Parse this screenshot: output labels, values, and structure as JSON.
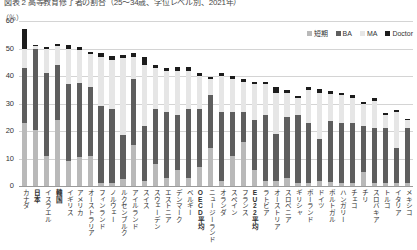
{
  "figure": {
    "title": "図表 2  高等教育修了者の割合（25～34歳、学位レベル別、2021年）",
    "unit_label": "（％）"
  },
  "legend": {
    "position": "top-right",
    "items": [
      {
        "label": "短期",
        "color": "#b9b9b9",
        "key": "short"
      },
      {
        "label": "BA",
        "color": "#5e5e5e",
        "key": "ba"
      },
      {
        "label": "MA",
        "color": "#e6e6e6",
        "key": "ma"
      },
      {
        "label": "Doctor",
        "color": "#1c1c1c",
        "key": "doc"
      }
    ]
  },
  "chart_data": {
    "type": "bar",
    "stacked": true,
    "title": "図表 2  高等教育修了者の割合（25～34歳、学位レベル別、2021年）",
    "xlabel": "",
    "ylabel": "（％）",
    "ylim": [
      0,
      60
    ],
    "yticks": [
      0,
      10,
      20,
      30,
      40,
      50,
      60
    ],
    "grid": true,
    "legend_position": "top-right",
    "categories": [
      "カナダ",
      "日本",
      "イスラエル",
      "韓国",
      "イギリス",
      "アメリカ",
      "オーストラリア",
      "フィンランド",
      "ノルウェー",
      "ルクセンブルク",
      "アイルランド",
      "スイス",
      "スウェーデン",
      "エストニア",
      "デンマーク",
      "ベルギー",
      "OECD平均",
      "ニュージーランド",
      "オランダ",
      "スペイン",
      "フランス",
      "EU22平均",
      "ラトビア",
      "オーストリア",
      "スロベニア",
      "ギリシャ",
      "ポーランド",
      "ドイツ",
      "ポルトガル",
      "ハンガリー",
      "チェコ",
      "チリ",
      "スロバキア",
      "トルコ",
      "イタリア",
      "メキシコ"
    ],
    "series": [
      {
        "name": "短期",
        "color": "#b9b9b9",
        "values": [
          23.0,
          20.5,
          11.0,
          24.0,
          9.0,
          10.5,
          11.0,
          1.0,
          1.0,
          2.5,
          15.0,
          2.0,
          8.0,
          3.0,
          6.0,
          3.0,
          7.0,
          14.0,
          2.0,
          11.0,
          16.0,
          6.0,
          2.0,
          2.0,
          3.0,
          1.0,
          1.0,
          2.0,
          1.5,
          1.0,
          1.0,
          5.0,
          1.0,
          1.0,
          1.0,
          1.0
        ]
      },
      {
        "name": "BA",
        "color": "#5e5e5e",
        "values": [
          20.0,
          29.5,
          30.0,
          20.0,
          28.0,
          27.0,
          25.0,
          28.0,
          27.0,
          16.0,
          24.0,
          20.0,
          20.0,
          24.0,
          20.0,
          25.0,
          21.0,
          19.0,
          25.0,
          16.0,
          11.0,
          18.0,
          24.0,
          17.0,
          22.0,
          25.0,
          22.0,
          15.0,
          22.0,
          22.0,
          22.0,
          17.0,
          20.0,
          20.0,
          13.0,
          20.0
        ]
      },
      {
        "name": "MA",
        "color": "#e6e6e6",
        "values": [
          7.0,
          0.8,
          9.0,
          7.0,
          13.0,
          12.0,
          12.0,
          18.0,
          18.0,
          28.0,
          8.0,
          22.0,
          15.0,
          15.0,
          16.0,
          14.0,
          12.0,
          6.0,
          13.0,
          12.0,
          11.0,
          13.0,
          11.0,
          15.0,
          9.0,
          6.0,
          12.0,
          17.0,
          10.0,
          10.0,
          9.0,
          8.0,
          10.0,
          5.0,
          13.0,
          3.0
        ]
      },
      {
        "name": "Doctor",
        "color": "#1c1c1c",
        "values": [
          7.0,
          0.4,
          0.6,
          0.6,
          1.2,
          1.0,
          0.8,
          1.2,
          1.2,
          1.3,
          1.3,
          3.0,
          1.0,
          1.0,
          1.2,
          1.2,
          1.0,
          0.8,
          1.2,
          1.0,
          1.0,
          1.0,
          0.8,
          2.0,
          1.0,
          0.8,
          1.0,
          1.2,
          1.0,
          0.8,
          1.2,
          0.6,
          1.0,
          0.6,
          0.6,
          0.4
        ]
      }
    ],
    "totals": [
      57.0,
      51.2,
      50.6,
      51.6,
      51.2,
      50.5,
      48.8,
      48.2,
      47.2,
      47.8,
      48.3,
      47.0,
      44.0,
      43.0,
      43.2,
      43.2,
      41.0,
      39.8,
      41.2,
      40.0,
      39.0,
      38.0,
      37.8,
      36.0,
      35.0,
      32.8,
      36.0,
      35.2,
      34.5,
      33.8,
      33.2,
      30.6,
      32.0,
      26.6,
      27.6,
      24.4
    ],
    "highlight_categories": [
      "日本",
      "韓国",
      "OECD平均",
      "EU22平均"
    ]
  }
}
